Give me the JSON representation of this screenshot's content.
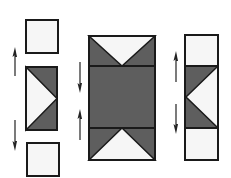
{
  "diagram": {
    "type": "quilt-block-assembly",
    "colors": {
      "dark_fabric": "#5e5e5e",
      "light_fabric": "#f6f6f6",
      "outline": "#1a1a1a",
      "arrow": "#222222"
    },
    "units": [
      {
        "id": "left-top-square",
        "kind": "square",
        "x": 26,
        "y": 20,
        "w": 32,
        "h": 33
      },
      {
        "id": "left-flying-geese",
        "kind": "flying-geese-right",
        "x": 26,
        "y": 67,
        "w": 31,
        "h": 63
      },
      {
        "id": "left-bottom-square",
        "kind": "square",
        "x": 27,
        "y": 143,
        "w": 32,
        "h": 33
      },
      {
        "id": "center-column",
        "kind": "hourglass-column",
        "x": 89,
        "y": 36,
        "w": 66,
        "h": 124,
        "dividers": [
          66,
          128
        ]
      },
      {
        "id": "right-column",
        "kind": "flying-geese-left-column",
        "x": 185,
        "y": 35,
        "w": 33,
        "h": 125,
        "dividers": [
          66,
          128
        ]
      }
    ],
    "arrows": [
      {
        "id": "left-up-arrow",
        "direction": "up",
        "x": 15,
        "y1": 76,
        "y2": 48
      },
      {
        "id": "left-down-arrow",
        "direction": "down",
        "x": 15,
        "y1": 120,
        "y2": 150
      },
      {
        "id": "center-down-arrow",
        "direction": "down",
        "x": 80,
        "y1": 62,
        "y2": 92
      },
      {
        "id": "center-up-arrow",
        "direction": "up",
        "x": 80,
        "y1": 140,
        "y2": 110
      },
      {
        "id": "right-up-arrow",
        "direction": "up",
        "x": 176,
        "y1": 82,
        "y2": 52
      },
      {
        "id": "right-down-arrow",
        "direction": "down",
        "x": 176,
        "y1": 104,
        "y2": 133
      }
    ]
  }
}
